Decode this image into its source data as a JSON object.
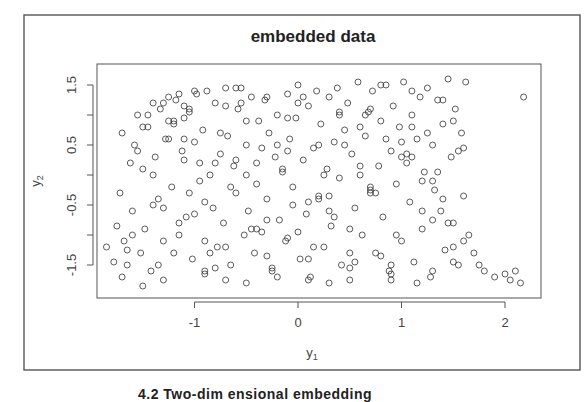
{
  "chart_data": {
    "type": "scatter",
    "title": "embedded data",
    "xlabel": "y1",
    "ylabel": "y2",
    "xlabel_main": "y",
    "xlabel_sub": "1",
    "ylabel_main": "y",
    "ylabel_sub": "2",
    "xlim": [
      -1.95,
      2.3
    ],
    "ylim": [
      -1.95,
      1.75
    ],
    "x_ticks": [
      -1,
      0,
      1,
      2
    ],
    "x_tick_labels": [
      "-1",
      "0",
      "1",
      "2"
    ],
    "y_ticks": [
      -1.5,
      -1,
      -0.5,
      0,
      0.5,
      1,
      1.5
    ],
    "y_tick_labels": [
      "-1.5",
      "",
      "-0.5",
      "",
      "0.5",
      "",
      "1.5"
    ],
    "grid": false,
    "legend": null,
    "marker": "open-circle",
    "marker_color": "#333333",
    "point_count_approx": 900,
    "x": [
      -1.85,
      -1.78,
      -1.75,
      -1.7,
      -1.72,
      -1.68,
      -1.65,
      -1.62,
      -1.6,
      -1.58,
      -1.55,
      -1.52,
      -1.5,
      -1.48,
      -1.45,
      -1.42,
      -1.4,
      -1.38,
      -1.35,
      -1.33,
      -1.3,
      -1.28,
      -1.25,
      -1.22,
      -1.2,
      -1.18,
      -1.15,
      -1.12,
      -1.1,
      -1.08,
      -1.05,
      -1.02,
      -1.0,
      -0.98,
      -0.95,
      -0.92,
      -0.9,
      -0.88,
      -0.85,
      -0.82,
      -0.8,
      -0.78,
      -0.75,
      -0.72,
      -0.7,
      -0.68,
      -0.65,
      -0.62,
      -0.6,
      -0.58,
      -0.55,
      -0.52,
      -0.5,
      -0.48,
      -0.45,
      -0.42,
      -0.4,
      -0.38,
      -0.35,
      -0.32,
      -0.3,
      -0.28,
      -0.25,
      -0.22,
      -0.2,
      -0.18,
      -0.15,
      -0.12,
      -0.1,
      -0.08,
      -0.05,
      -0.02,
      0.0,
      0.02,
      0.05,
      0.08,
      0.1,
      0.12,
      0.15,
      0.18,
      0.2,
      0.22,
      0.25,
      0.28,
      0.3,
      0.32,
      0.35,
      0.38,
      0.4,
      0.42,
      0.45,
      0.48,
      0.5,
      0.52,
      0.55,
      0.58,
      0.6,
      0.62,
      0.65,
      0.68,
      0.7,
      0.72,
      0.75,
      0.78,
      0.8,
      0.82,
      0.85,
      0.88,
      0.9,
      0.92,
      0.95,
      0.98,
      1.0,
      1.02,
      1.05,
      1.08,
      1.1,
      1.12,
      1.15,
      1.18,
      1.2,
      1.22,
      1.25,
      1.28,
      1.3,
      1.32,
      1.35,
      1.38,
      1.4,
      1.42,
      1.45,
      1.48,
      1.5,
      1.52,
      1.55,
      1.58,
      1.6,
      1.62,
      1.65,
      1.7,
      1.75,
      1.8,
      1.9,
      2.0,
      2.05,
      2.1,
      2.15,
      2.18,
      -1.6,
      -1.5,
      -1.4,
      -1.3,
      -1.25,
      -1.2,
      -1.15,
      -1.1,
      -1.05,
      -1.0,
      -0.9,
      -0.8,
      -0.7,
      -0.6,
      -0.5,
      -0.4,
      -0.3,
      -0.2,
      -0.1,
      0.0,
      0.1,
      0.2,
      0.3,
      0.4,
      0.5,
      0.6,
      0.7,
      0.8,
      0.9,
      1.0,
      1.1,
      1.2,
      1.3,
      1.4,
      1.5,
      1.6,
      -1.55,
      -1.45,
      -1.35,
      -1.25,
      -1.15,
      -1.05,
      -0.95,
      -0.85,
      -0.75,
      -0.65,
      -0.55,
      -0.45,
      -0.35,
      -0.25,
      -0.15,
      -0.05,
      0.05,
      0.15,
      0.25,
      0.35,
      0.45,
      0.55,
      0.65,
      0.75,
      0.85,
      0.95,
      1.05,
      1.15,
      1.25,
      1.35,
      1.45,
      1.55,
      -1.65,
      -1.4,
      -1.2,
      -1.0,
      -0.8,
      -0.6,
      -0.4,
      -0.2,
      0.0,
      0.2,
      0.4,
      0.6,
      0.8,
      1.0,
      1.2,
      1.4,
      1.6,
      -1.3,
      -1.1,
      -0.9,
      -0.7,
      -0.5,
      -0.3,
      -0.1,
      0.1,
      0.3,
      0.5,
      0.7,
      0.9,
      1.1,
      1.3,
      1.5,
      -1.7,
      -1.5,
      -1.3,
      -1.1,
      -0.9,
      -0.7,
      -0.5,
      -0.3,
      -0.1,
      0.1,
      0.3,
      0.5,
      0.7,
      0.9,
      1.1,
      1.3,
      1.5
    ],
    "y": [
      -1.2,
      -1.45,
      -0.85,
      -1.7,
      -0.3,
      -1.1,
      -1.5,
      0.2,
      -0.6,
      0.5,
      1.0,
      -1.3,
      0.1,
      -0.9,
      0.8,
      -1.6,
      1.2,
      0.3,
      -0.4,
      1.1,
      -1.75,
      0.6,
      1.3,
      -0.2,
      0.9,
      1.25,
      -1.0,
      0.4,
      1.15,
      -0.7,
      1.05,
      -1.4,
      0.55,
      1.35,
      -0.1,
      0.75,
      -1.65,
      1.4,
      0.0,
      -0.55,
      1.2,
      -1.2,
      0.35,
      -0.8,
      1.45,
      0.65,
      -1.5,
      0.15,
      -0.3,
      1.1,
      1.45,
      -1.0,
      0.5,
      -0.6,
      1.3,
      -1.3,
      0.2,
      0.9,
      -0.95,
      1.25,
      -0.4,
      0.7,
      -1.55,
      0.3,
      1.0,
      -0.75,
      0.05,
      -1.1,
      1.35,
      0.6,
      -0.2,
      0.95,
      1.5,
      -1.4,
      0.25,
      -0.65,
      1.15,
      -1.7,
      0.45,
      1.4,
      -0.35,
      0.85,
      -1.2,
      0.1,
      1.3,
      -0.85,
      0.55,
      1.45,
      -0.05,
      -1.5,
      0.75,
      1.2,
      -1.75,
      0.35,
      -0.55,
      1.55,
      0.0,
      -1.0,
      0.65,
      1.05,
      -0.3,
      1.4,
      -1.3,
      0.15,
      0.9,
      -0.7,
      1.5,
      -1.6,
      0.4,
      1.15,
      -0.15,
      0.8,
      -1.1,
      1.55,
      0.2,
      -0.45,
      1.0,
      -1.45,
      0.6,
      1.3,
      -0.9,
      0.05,
      1.45,
      -1.7,
      0.5,
      -0.25,
      1.25,
      -0.6,
      0.85,
      -1.25,
      1.6,
      0.3,
      -0.8,
      1.1,
      -1.5,
      0.7,
      -0.35,
      1.55,
      -1.0,
      -1.3,
      -1.5,
      -1.6,
      -1.7,
      -1.65,
      -1.75,
      -1.6,
      -1.8,
      1.3,
      -1.0,
      0.8,
      -0.5,
      1.2,
      0.9,
      -1.3,
      1.35,
      0.6,
      -0.3,
      1.4,
      -1.6,
      0.2,
      -1.2,
      1.45,
      0.9,
      -0.9,
      1.3,
      -1.7,
      0.4,
      1.2,
      -1.4,
      0.5,
      -0.6,
      1.0,
      -1.3,
      0.8,
      -0.2,
      1.5,
      -1.5,
      0.3,
      1.4,
      -0.6,
      -1.6,
      -0.4,
      0.9,
      -1.1,
      0.4,
      1.0,
      -1.5,
      0.6,
      -0.8,
      1.1,
      0.2,
      -1.3,
      0.7,
      -0.2,
      1.2,
      -0.9,
      0.45,
      -1.6,
      0.1,
      -0.5,
      1.3,
      -1.2,
      0.0,
      -0.7,
      0.5,
      -1.45,
      1.0,
      -0.3,
      0.6,
      -1.0,
      0.35,
      -1.8,
      0.7,
      0.05,
      -0.8,
      0.4,
      -1.25,
      0.0,
      0.85,
      -0.65,
      -1.55,
      0.25,
      -0.15,
      0.5,
      -0.95,
      -0.4,
      1.05,
      0.15,
      -1.35,
      0.55,
      -0.1,
      1.25,
      0.45,
      -1.1,
      0.95,
      -0.45,
      1.15,
      -1.8,
      -1.35,
      0.95,
      -1.75,
      -0.35,
      -1.55,
      1.1,
      -1.75,
      0.3,
      -0.1,
      -1.2,
      0.7,
      -1.85,
      -0.55,
      0.25,
      -1.1,
      -1.75,
      0.0,
      -0.75,
      -1.05,
      -0.45,
      -1.8,
      -0.9,
      -0.25,
      -1.65,
      0.8,
      -0.75,
      -1.45
    ]
  },
  "caption": "4.2 Two-dim ensional embedding"
}
